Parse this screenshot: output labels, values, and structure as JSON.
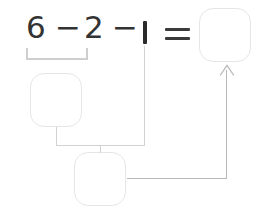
{
  "page": {
    "kind": "math-worksheet-diagram",
    "width": 264,
    "height": 211,
    "background_color": "#ffffff"
  },
  "equation": {
    "expression": "6 − 2 − 1 =",
    "terms": [
      {
        "name": "first-operand",
        "text": "6"
      },
      {
        "name": "minus-1",
        "text": "−"
      },
      {
        "name": "second-operand",
        "text": "2"
      },
      {
        "name": "minus-2",
        "text": "−"
      },
      {
        "name": "third-operand",
        "text": "1"
      },
      {
        "name": "equals",
        "text": "="
      }
    ],
    "digit_color": "#333333",
    "operator_color": "#3a3a3a"
  },
  "answer_boxes": [
    {
      "name": "partial-result-box",
      "label": "",
      "placeholder": "",
      "role": "result of 6 − 2",
      "border_color": "#e6e6e6"
    },
    {
      "name": "second-step-box",
      "label": "",
      "placeholder": "",
      "role": "result of (6 − 2) − 1",
      "border_color": "#e6e6e6"
    },
    {
      "name": "final-answer-box",
      "label": "",
      "placeholder": "",
      "role": "final answer after =",
      "border_color": "#e6e6e6"
    }
  ],
  "annotations": {
    "grouping_bracket": {
      "name": "grouping-bracket-6-minus-2",
      "spans": "6 − 2",
      "color": "#cfcfcf"
    },
    "connectors": [
      {
        "name": "connector-partial-to-second-step",
        "from": "partial-result-box",
        "to": "second-step-box",
        "color": "#d2d2d2"
      },
      {
        "name": "connector-third-operand-to-second-step",
        "from": "third-operand",
        "to": "second-step-box",
        "color": "#d2d2d2"
      },
      {
        "name": "connector-second-step-to-final-answer",
        "from": "second-step-box",
        "to": "final-answer-box",
        "color": "#b8b8b8",
        "arrowhead": true
      }
    ],
    "arrow_icon_name": "arrow-up-icon"
  }
}
